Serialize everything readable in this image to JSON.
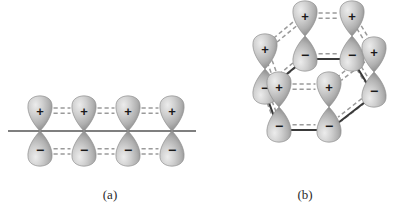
{
  "figure": {
    "domain_kind": "diagram",
    "background_color": "#ffffff",
    "axis_color": "#555555",
    "bond_color": "#3a3a3a",
    "dash_color": "#9a9a9a",
    "lobe_light": "#e6e6e6",
    "lobe_mid": "#b8b8b8",
    "lobe_dark": "#8d8d8d",
    "sign_color": "#1a1a1a"
  },
  "panels": [
    {
      "id": "a",
      "caption": "(a)",
      "caption_x": 110,
      "caption_y": 199,
      "description": "linear chain of four p-orbital pairs above and below a horizontal axis",
      "axis": {
        "x1": 8,
        "y1": 131,
        "x2": 196,
        "y2": 131
      },
      "orbital_count": 4,
      "orbitals": [
        {
          "cx": 40,
          "cy": 131,
          "top_sign": "+",
          "bottom_sign": "−"
        },
        {
          "cx": 84,
          "cy": 131,
          "top_sign": "+",
          "bottom_sign": "−"
        },
        {
          "cx": 128,
          "cy": 131,
          "top_sign": "+",
          "bottom_sign": "−"
        },
        {
          "cx": 172,
          "cy": 131,
          "top_sign": "+",
          "bottom_sign": "−"
        }
      ],
      "overlap_links": [
        {
          "from": 0,
          "to": 1,
          "half": "top"
        },
        {
          "from": 1,
          "to": 2,
          "half": "top"
        },
        {
          "from": 2,
          "to": 3,
          "half": "top"
        },
        {
          "from": 0,
          "to": 1,
          "half": "bottom"
        },
        {
          "from": 1,
          "to": 2,
          "half": "bottom"
        },
        {
          "from": 2,
          "to": 3,
          "half": "bottom"
        }
      ]
    },
    {
      "id": "b",
      "caption": "(b)",
      "caption_x": 305,
      "caption_y": 199,
      "description": "hexagonal ring of six p-orbital pairs drawn in perspective",
      "orbital_count": 6,
      "orbitals": [
        {
          "name": "back-left",
          "cx": 305,
          "cy": 36,
          "top_sign": "+",
          "bottom_sign": "−"
        },
        {
          "name": "back-right",
          "cx": 352,
          "cy": 36,
          "top_sign": "+",
          "bottom_sign": "−"
        },
        {
          "name": "mid-left",
          "cx": 265,
          "cy": 69,
          "top_sign": "+",
          "bottom_sign": "−"
        },
        {
          "name": "mid-right",
          "cx": 374,
          "cy": 72,
          "top_sign": "+",
          "bottom_sign": "−"
        },
        {
          "name": "front-left",
          "cx": 279,
          "cy": 107,
          "top_sign": "+",
          "bottom_sign": "−"
        },
        {
          "name": "front-right",
          "cx": 329,
          "cy": 107,
          "top_sign": "+",
          "bottom_sign": "−"
        }
      ],
      "ring_bonds": [
        {
          "x1": 305,
          "y1": 59,
          "x2": 352,
          "y2": 59
        },
        {
          "x1": 352,
          "y1": 59,
          "x2": 374,
          "y2": 95
        },
        {
          "x1": 374,
          "y1": 95,
          "x2": 329,
          "y2": 130
        },
        {
          "x1": 329,
          "y1": 130,
          "x2": 279,
          "y2": 130
        },
        {
          "x1": 279,
          "y1": 130,
          "x2": 265,
          "y2": 92
        },
        {
          "x1": 265,
          "y1": 92,
          "x2": 305,
          "y2": 59
        }
      ],
      "overlap_links": [
        {
          "from": 0,
          "to": 1,
          "half": "top"
        },
        {
          "from": 0,
          "to": 2,
          "half": "top"
        },
        {
          "from": 1,
          "to": 3,
          "half": "top"
        },
        {
          "from": 2,
          "to": 4,
          "half": "top"
        },
        {
          "from": 3,
          "to": 5,
          "half": "top"
        },
        {
          "from": 4,
          "to": 5,
          "half": "top"
        },
        {
          "from": 0,
          "to": 1,
          "half": "bottom"
        },
        {
          "from": 0,
          "to": 2,
          "half": "bottom"
        },
        {
          "from": 1,
          "to": 3,
          "half": "bottom"
        },
        {
          "from": 2,
          "to": 4,
          "half": "bottom"
        },
        {
          "from": 3,
          "to": 5,
          "half": "bottom"
        },
        {
          "from": 4,
          "to": 5,
          "half": "bottom"
        }
      ]
    }
  ]
}
